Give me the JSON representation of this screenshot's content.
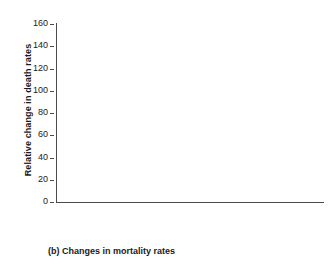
{
  "caption": "(b) Changes in mortality rates",
  "legend": {
    "position": "top-right",
    "entries": [
      {
        "label": "1981",
        "color": "#5c5c5c"
      },
      {
        "label": "2015",
        "color": "#1f1f1f"
      }
    ]
  },
  "axes": {
    "y_title": "Relative change in death rates",
    "y_ticks": [
      "0",
      "20",
      "40",
      "60",
      "80",
      "100",
      "120",
      "140",
      "160"
    ],
    "x_title": ""
  },
  "categories": [
    {
      "label": "All causes"
    },
    {
      "label": "Cancer"
    },
    {
      "label": "Cardio-\nvascular\ndiseases"
    },
    {
      "label": "Kidney\ndisease"
    },
    {
      "label": "Diabetes"
    }
  ],
  "chart_data": {
    "type": "bar",
    "title": "(b) Changes in mortality rates",
    "xlabel": "",
    "ylabel": "Relative change in death rates",
    "ylim": [
      0,
      160
    ],
    "ytick_step": 20,
    "grid": false,
    "legend_position": "top-right",
    "categories": [
      "All causes",
      "Cancer",
      "Cardio-vascular diseases",
      "Kidney disease",
      "Diabetes"
    ],
    "series": [
      {
        "name": "1981",
        "color": "#5c5c5c",
        "values": [
          100,
          100,
          100,
          100,
          100
        ]
      },
      {
        "name": "2015",
        "color": "#1f1f1f",
        "values": [
          72,
          76,
          39,
          144,
          119
        ]
      }
    ]
  }
}
